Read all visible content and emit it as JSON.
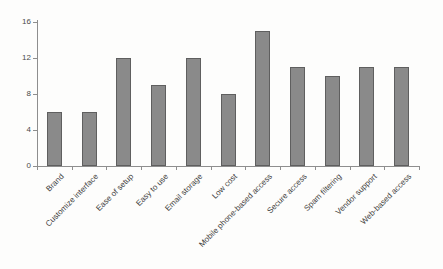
{
  "chart_data": {
    "type": "bar",
    "title": "",
    "xlabel": "",
    "ylabel": "",
    "categories": [
      "Brand",
      "Customize interface",
      "Ease of setup",
      "Easy to use",
      "Email storage",
      "Low cost",
      "Mobile phone-based access",
      "Secure access",
      "Spam filtering",
      "Vendor support",
      "Web-based access"
    ],
    "values": [
      6,
      6,
      12,
      9,
      12,
      8,
      15,
      11,
      10,
      11,
      11
    ],
    "ylim": [
      0,
      16
    ],
    "yticks": [
      0,
      4,
      8,
      12,
      16
    ],
    "grid": false,
    "legend_position": "none",
    "bar_color": "#8a8a8a",
    "bar_border_color": "#5f5f5f",
    "axis_color": "#8e8e8e",
    "tick_text_color": "#4a4a4a",
    "label_text_color": "#3d3d3d"
  }
}
